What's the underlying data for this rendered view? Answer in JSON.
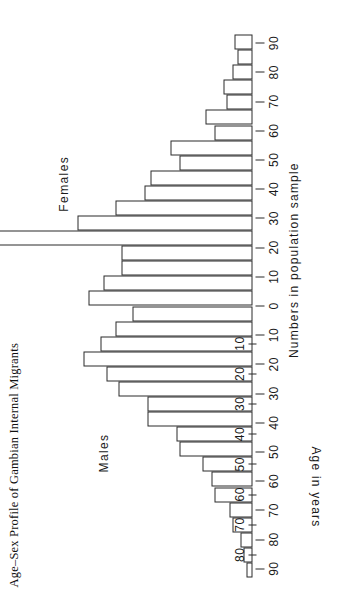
{
  "figure": {
    "title": "Age–Sex Profile of Gambian Internal Migrants",
    "x_axis_label": "Numbers in population sample",
    "y_axis_label": "Age in years",
    "left_group_label": "Males",
    "right_group_label": "Females"
  },
  "chart_data": {
    "type": "bar",
    "title": "Age–Sex Profile of Gambian Internal Migrants",
    "subtitle": "",
    "xlabel": "Numbers in population sample",
    "ylabel": "Age in years",
    "chart_kind": "population-pyramid",
    "grid": false,
    "legend_position": "inside-top",
    "orientation": "horizontal",
    "xlim": [
      -90,
      90
    ],
    "x_tick_values": [
      -90,
      -80,
      -70,
      -60,
      -50,
      -40,
      -30,
      -20,
      -10,
      0,
      10,
      20,
      30,
      40,
      50,
      60,
      70,
      80,
      90
    ],
    "x_tick_labels": [
      "90",
      "80",
      "70",
      "60",
      "50",
      "40",
      "30",
      "20",
      "10",
      "0",
      "10",
      "20",
      "30",
      "40",
      "50",
      "60",
      "70",
      "80",
      "90"
    ],
    "categories": [
      "0-4",
      "5-9",
      "10-14",
      "15-19",
      "20-24",
      "25-29",
      "30-34",
      "35-39",
      "40-44",
      "45-49",
      "50-54",
      "55-59",
      "60-64",
      "65-69",
      "70-74",
      "75-79",
      "80-84",
      "85+"
    ],
    "y_tick_labels": [
      "10",
      "20",
      "30",
      "40",
      "50",
      "60",
      "70",
      "80"
    ],
    "y_tick_categories": [
      "10-14",
      "20-24",
      "30-34",
      "40-44",
      "50-54",
      "60-64",
      "70-74",
      "80-84"
    ],
    "series": [
      {
        "name": "Males",
        "side": "left",
        "values": [
          41,
          47,
          52,
          58,
          50,
          46,
          36,
          36,
          26,
          25,
          17,
          14,
          13,
          8,
          7,
          4,
          3,
          2
        ]
      },
      {
        "name": "Females",
        "side": "right",
        "values": [
          56,
          51,
          45,
          45,
          90,
          60,
          47,
          37,
          35,
          25,
          28,
          13,
          16,
          9,
          10,
          7,
          5,
          6
        ]
      }
    ]
  }
}
